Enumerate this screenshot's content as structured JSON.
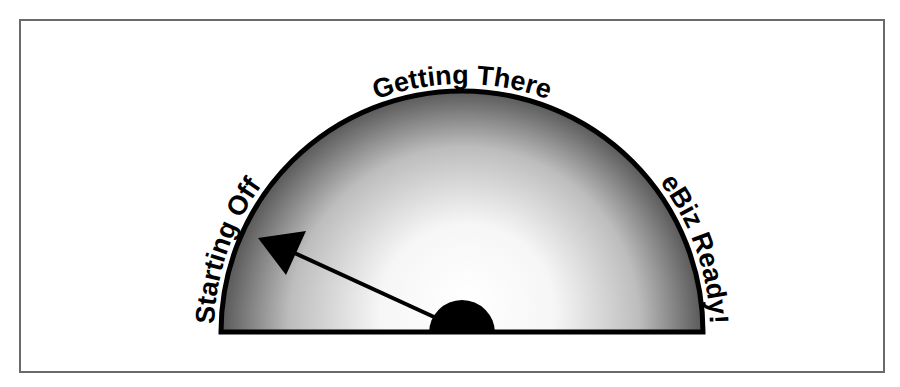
{
  "gauge": {
    "labels": {
      "left": "Starting Off",
      "top": "Getting There",
      "right": "eBiz Ready!"
    },
    "needle_position": "Starting Off",
    "colors": {
      "frame": "#6a6a6a",
      "outline": "#000000",
      "gradient_center": "#ffffff",
      "gradient_edge": "#4a4a4a",
      "needle": "#000000"
    }
  }
}
